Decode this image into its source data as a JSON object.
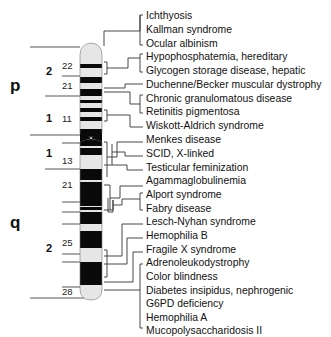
{
  "chromosome": {
    "name": "X chromosome",
    "arms": [
      {
        "label": "p"
      },
      {
        "label": "q"
      }
    ],
    "regions": [
      {
        "label": "2",
        "arm": "p"
      },
      {
        "label": "1",
        "arm": "p"
      },
      {
        "label": "1",
        "arm": "q"
      },
      {
        "label": "2",
        "arm": "q"
      }
    ],
    "bands": [
      {
        "label": "22"
      },
      {
        "label": "21"
      },
      {
        "label": "11"
      },
      {
        "label": "13"
      },
      {
        "label": "21"
      },
      {
        "label": "25"
      },
      {
        "label": "28"
      }
    ],
    "colors": {
      "dark_band": "#0a0a0a",
      "light_band": "#e6e6e6",
      "line": "#333333"
    }
  },
  "diseases": [
    {
      "label": "Ichthyosis"
    },
    {
      "label": "Kallman syndrome"
    },
    {
      "label": "Ocular albinism"
    },
    {
      "label": "Hypophosphatemia, hereditary"
    },
    {
      "label": "Glycogen storage disease, hepatic"
    },
    {
      "label": "Duchenne/Becker muscular dystrophy"
    },
    {
      "label": "Chronic granulomatous disease"
    },
    {
      "label": "Retinitis pigmentosa"
    },
    {
      "label": "Wiskott-Aldrich syndrome"
    },
    {
      "label": "Menkes disease"
    },
    {
      "label": "SCID, X-linked"
    },
    {
      "label": "Testicular feminization"
    },
    {
      "label": "Agammaglobulinemia"
    },
    {
      "label": "Alport syndrome"
    },
    {
      "label": "Fabry disease"
    },
    {
      "label": "Lesch-Nyhan syndrome"
    },
    {
      "label": "Hemophilia B"
    },
    {
      "label": "Fragile X syndrome"
    },
    {
      "label": "Adrenoleukodystrophy"
    },
    {
      "label": "Color blindness"
    },
    {
      "label": "Diabetes insipidus, nephrogenic"
    },
    {
      "label": "G6PD deficiency"
    },
    {
      "label": "Hemophilia A"
    },
    {
      "label": "Mucopolysaccharidosis II"
    }
  ]
}
